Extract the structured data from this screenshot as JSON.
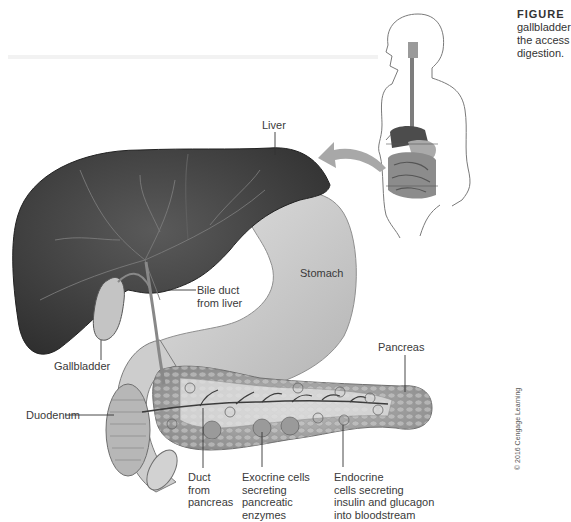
{
  "caption": {
    "figure_label": "FIGURE",
    "lines": [
      "gallbladder",
      "the access",
      "digestion."
    ]
  },
  "labels": {
    "liver": "Liver",
    "stomach": "Stomach",
    "bile_duct": "Bile duct\nfrom liver",
    "gallbladder": "Gallbladder",
    "pancreas": "Pancreas",
    "duodenum": "Duodenum",
    "duct_from_pancreas": "Duct\nfrom\npancreas",
    "exocrine": "Exocrine cells\nsecreting\npancreatic\nenzymes",
    "endocrine": "Endocrine\ncells secreting\ninsulin and glucagon\ninto bloodstream"
  },
  "copyright": "© 2016 Cengage Learning",
  "colors": {
    "liver": "#4a4a4a",
    "liver_dark": "#2e2e2e",
    "organ_light": "#c8c8c8",
    "arrow": "#a8a8a8"
  }
}
